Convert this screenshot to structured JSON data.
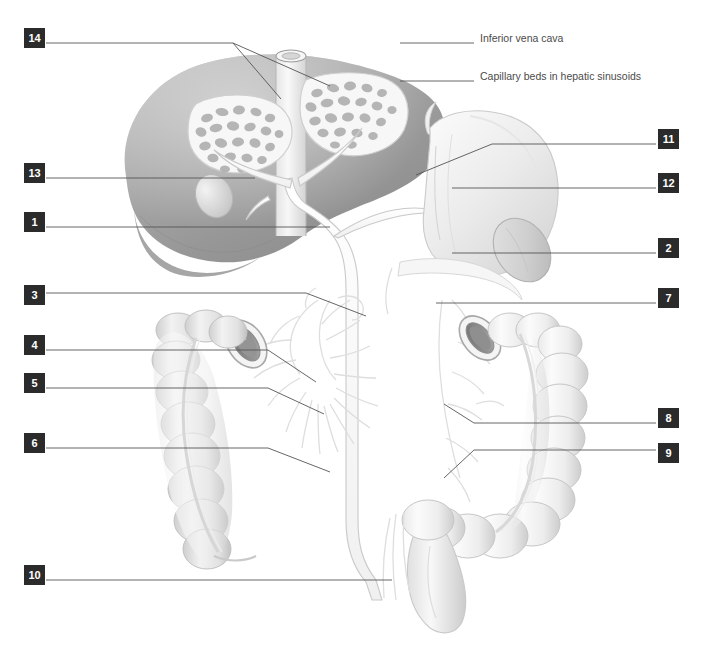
{
  "figure": {
    "background_color": "#ffffff",
    "box_color": "#2b2b2b",
    "box_text_color": "#ffffff",
    "leader_color": "#555555",
    "label_text_color": "#4b4b4b"
  },
  "text_labels": [
    {
      "id": "inferior-vena-cava",
      "text": "Inferior vena cava",
      "x": 480,
      "y": 38,
      "leader": {
        "x1": 400,
        "y1": 43,
        "x2": 474,
        "y2": 43
      }
    },
    {
      "id": "capillary-beds",
      "text": "Capillary beds in hepatic sinusoids",
      "x": 480,
      "y": 76,
      "leader": {
        "x1": 400,
        "y1": 81,
        "x2": 474,
        "y2": 81
      }
    }
  ],
  "numbered_callouts": [
    {
      "number": "14",
      "side": "left",
      "box_x": 24,
      "box_y": 28,
      "leader": [
        [
          46,
          43
        ],
        [
          233,
          43
        ],
        [
          281,
          99
        ]
      ],
      "leader2": [
        [
          233,
          43
        ],
        [
          330,
          86
        ]
      ]
    },
    {
      "number": "13",
      "side": "left",
      "box_x": 24,
      "box_y": 163,
      "leader": [
        [
          46,
          178
        ],
        [
          255,
          178
        ]
      ]
    },
    {
      "number": "1",
      "side": "left",
      "box_x": 24,
      "box_y": 212,
      "leader": [
        [
          46,
          227
        ],
        [
          330,
          227
        ]
      ]
    },
    {
      "number": "3",
      "side": "left",
      "box_x": 24,
      "box_y": 285,
      "leader": [
        [
          46,
          293
        ],
        [
          306,
          293
        ],
        [
          366,
          316
        ]
      ]
    },
    {
      "number": "4",
      "side": "left",
      "box_x": 24,
      "box_y": 335,
      "leader": [
        [
          46,
          350
        ],
        [
          268,
          350
        ],
        [
          316,
          382
        ]
      ]
    },
    {
      "number": "5",
      "side": "left",
      "box_x": 24,
      "box_y": 373,
      "leader": [
        [
          46,
          388
        ],
        [
          268,
          388
        ],
        [
          324,
          414
        ]
      ]
    },
    {
      "number": "6",
      "side": "left",
      "box_x": 24,
      "box_y": 433,
      "leader": [
        [
          46,
          448
        ],
        [
          268,
          448
        ],
        [
          330,
          472
        ]
      ]
    },
    {
      "number": "10",
      "side": "left",
      "box_x": 24,
      "box_y": 565,
      "leader": [
        [
          46,
          580
        ],
        [
          392,
          580
        ]
      ]
    },
    {
      "number": "11",
      "side": "right",
      "box_x": 658,
      "box_y": 129,
      "leader": [
        [
          656,
          144
        ],
        [
          492,
          144
        ],
        [
          416,
          175
        ]
      ]
    },
    {
      "number": "12",
      "side": "right",
      "box_x": 658,
      "box_y": 173,
      "leader": [
        [
          656,
          188
        ],
        [
          452,
          188
        ]
      ]
    },
    {
      "number": "2",
      "side": "right",
      "box_x": 658,
      "box_y": 238,
      "leader": [
        [
          656,
          253
        ],
        [
          452,
          253
        ]
      ]
    },
    {
      "number": "7",
      "side": "right",
      "box_x": 658,
      "box_y": 288,
      "leader": [
        [
          656,
          303
        ],
        [
          436,
          303
        ]
      ]
    },
    {
      "number": "8",
      "side": "right",
      "box_x": 658,
      "box_y": 408,
      "leader": [
        [
          656,
          423
        ],
        [
          474,
          423
        ],
        [
          444,
          404
        ]
      ]
    },
    {
      "number": "9",
      "side": "right",
      "box_x": 658,
      "box_y": 443,
      "leader": [
        [
          656,
          450
        ],
        [
          474,
          450
        ],
        [
          444,
          478
        ]
      ]
    }
  ]
}
